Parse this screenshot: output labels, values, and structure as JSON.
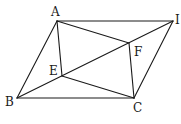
{
  "diagram": {
    "type": "geometry",
    "points": {
      "A": {
        "x": 57,
        "y": 21,
        "label": "A",
        "lx": 51,
        "ly": 16
      },
      "I": {
        "x": 173,
        "y": 21,
        "label": "I",
        "lx": 175,
        "ly": 24
      },
      "B": {
        "x": 17,
        "y": 98,
        "label": "B",
        "lx": 5,
        "ly": 106
      },
      "C": {
        "x": 134,
        "y": 98,
        "label": "C",
        "lx": 133,
        "ly": 112
      },
      "E": {
        "x": 62,
        "y": 76,
        "label": "E",
        "lx": 49,
        "ly": 75
      },
      "F": {
        "x": 129,
        "y": 43,
        "label": "F",
        "lx": 134,
        "ly": 56
      }
    },
    "segments": [
      [
        "A",
        "I"
      ],
      [
        "B",
        "C"
      ],
      [
        "A",
        "B"
      ],
      [
        "I",
        "C"
      ],
      [
        "B",
        "I"
      ],
      [
        "A",
        "E"
      ],
      [
        "E",
        "C"
      ],
      [
        "A",
        "F"
      ],
      [
        "F",
        "C"
      ]
    ]
  }
}
